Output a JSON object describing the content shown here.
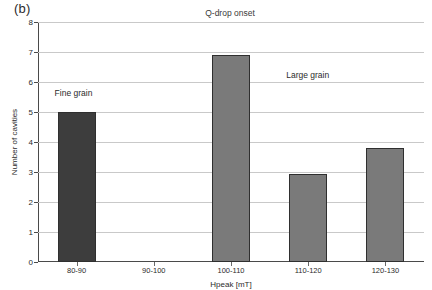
{
  "figure": {
    "panel_label": "(b)"
  },
  "chart_data": {
    "type": "bar",
    "title": "Q-drop onset",
    "xlabel": "Hpeak [mT]",
    "ylabel": "Number of cavities",
    "categories": [
      "80-90",
      "90-100",
      "100-110",
      "110-120",
      "120-130"
    ],
    "values": [
      5,
      0,
      6.9,
      2.95,
      3.8
    ],
    "ylim": [
      0,
      8
    ],
    "ytick_labels": [
      "0",
      "1",
      "2",
      "3",
      "4",
      "5",
      "6",
      "7",
      "8"
    ],
    "ytick_values": [
      0,
      1,
      2,
      3,
      4,
      5,
      6,
      7,
      8
    ],
    "grid": true,
    "legend": "none",
    "bar_colors": [
      "#3d3d3d",
      "#7a7a7a",
      "#7a7a7a",
      "#7a7a7a",
      "#7a7a7a"
    ],
    "annotations": [
      {
        "text": "Fine grain",
        "x_category": "80-90",
        "y_value": 5.6
      },
      {
        "text": "Large grain",
        "x_category": "110-120",
        "y_value": 6.2
      }
    ]
  },
  "colors": {
    "fine_grain_bar": "#3d3d3d",
    "large_grain_bar": "#7a7a7a",
    "gridline": "#c9c9c9",
    "axis": "#4a4a4a",
    "background": "#ffffff"
  }
}
